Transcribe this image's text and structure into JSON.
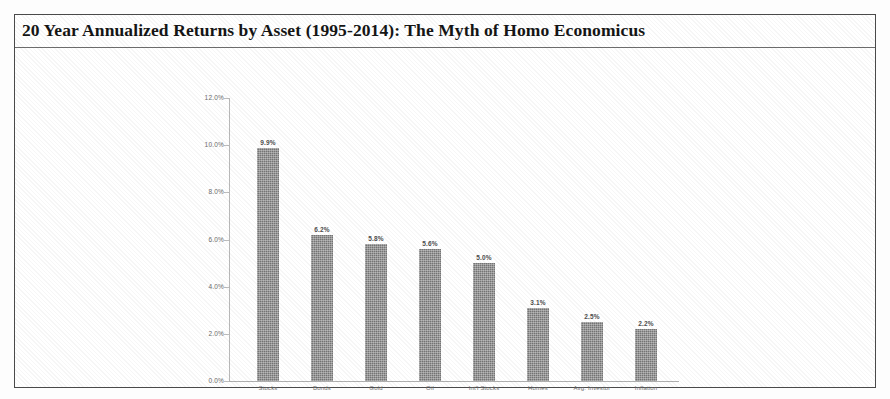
{
  "figure": {
    "title": "20 Year Annualized Returns by Asset (1995-2014): The Myth of Homo Economicus",
    "frame_color": "#4a4a4a",
    "bar_color": "#757575",
    "axis_color": "#b9b9b9",
    "background": "#ffffff"
  },
  "chart_data": {
    "type": "bar",
    "title": "20 Year Annualized Returns by Asset (1995-2014): The Myth of Homo Economicus",
    "xlabel": "",
    "ylabel": "",
    "categories": [
      "Stocks",
      "Bonds",
      "Gold",
      "Oil",
      "Int'l Stocks",
      "Homes",
      "Avg. Investor",
      "Inflation"
    ],
    "values": [
      9.9,
      6.2,
      5.8,
      5.6,
      5.0,
      3.1,
      2.5,
      2.2
    ],
    "value_labels": [
      "9.9%",
      "6.2%",
      "5.8%",
      "5.6%",
      "5.0%",
      "3.1%",
      "2.5%",
      "2.2%"
    ],
    "ylim": [
      0,
      12
    ],
    "ytick_values": [
      0,
      2,
      4,
      6,
      8,
      10,
      12
    ],
    "ytick_labels": [
      "0.0%",
      "2.0%",
      "4.0%",
      "6.0%",
      "8.0%",
      "10.0%",
      "12.0%"
    ],
    "grid": false,
    "legend": false,
    "series": [
      {
        "name": "20 Year Annualized Return",
        "values": [
          9.9,
          6.2,
          5.8,
          5.6,
          5.0,
          3.1,
          2.5,
          2.2
        ]
      }
    ]
  }
}
